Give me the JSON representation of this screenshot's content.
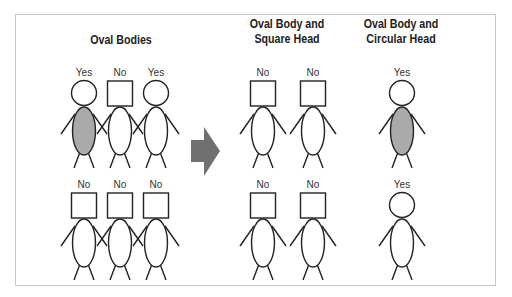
{
  "diagram": {
    "colors": {
      "stroke": "#222222",
      "filled_body": "#aaaaaa",
      "arrow": "#707070",
      "frame": "#c8c8c8"
    },
    "groups": [
      {
        "title": "Oval Bodies",
        "rows": [
          [
            {
              "label": "Yes",
              "head": "circle",
              "body_filled": true
            },
            {
              "label": "No",
              "head": "square",
              "body_filled": false
            },
            {
              "label": "Yes",
              "head": "circle",
              "body_filled": false
            }
          ],
          [
            {
              "label": "No",
              "head": "square",
              "body_filled": false
            },
            {
              "label": "No",
              "head": "square",
              "body_filled": false
            },
            {
              "label": "No",
              "head": "square",
              "body_filled": false
            }
          ]
        ]
      },
      {
        "title_line1": "Oval Body and",
        "title_line2": "Square Head",
        "rows": [
          [
            {
              "label": "No",
              "head": "square",
              "body_filled": false
            },
            {
              "label": "No",
              "head": "square",
              "body_filled": false
            }
          ],
          [
            {
              "label": "No",
              "head": "square",
              "body_filled": false
            },
            {
              "label": "No",
              "head": "square",
              "body_filled": false
            }
          ]
        ]
      },
      {
        "title_line1": "Oval Body and",
        "title_line2": "Circular Head",
        "rows": [
          [
            {
              "label": "Yes",
              "head": "circle",
              "body_filled": true
            }
          ],
          [
            {
              "label": "Yes",
              "head": "circle",
              "body_filled": false
            }
          ]
        ]
      }
    ],
    "arrow_icon": "right-arrow-icon"
  }
}
